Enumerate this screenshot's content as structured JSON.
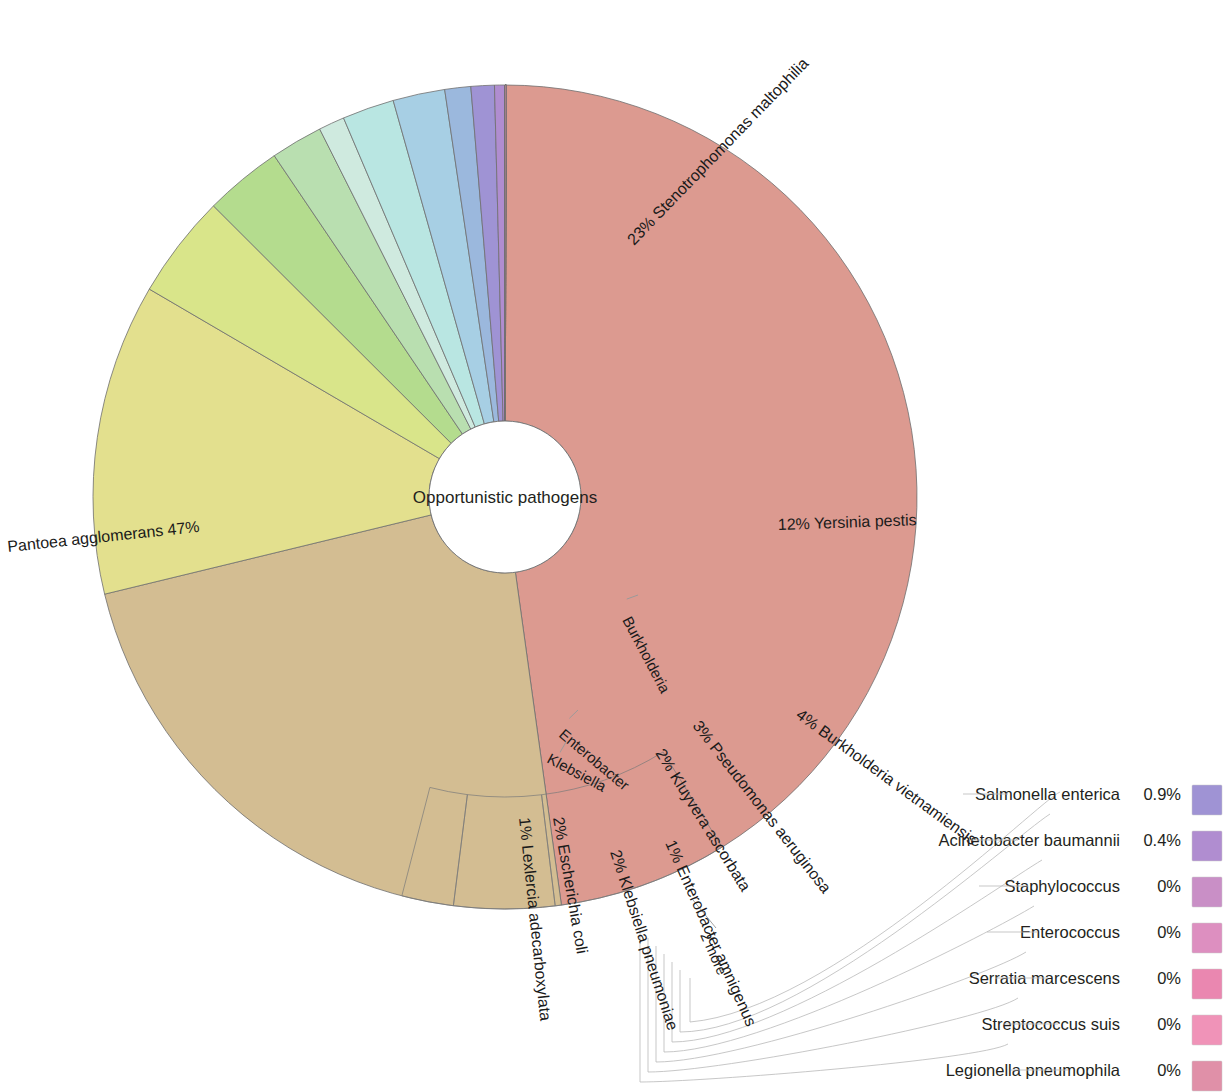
{
  "chart": {
    "type": "donut",
    "center_label": "Opportunistic pathogens",
    "title": "",
    "units": "percent"
  },
  "chart_data": {
    "type": "pie",
    "title": "Opportunistic pathogens",
    "center_label": "Opportunistic pathogens",
    "xlabel": "",
    "ylabel": "",
    "legend_position": "right",
    "grid": false,
    "value_suffix": "%",
    "categories": [
      "Pantoea agglomerans",
      "Stenotrophomonas maltophilia",
      "Yersinia pestis",
      "Burkholderia vietnamiensis",
      "Pseudomonas aeruginosa",
      "Kluyvera ascorbata",
      "Enterobacter amnigenus",
      "Klebsiella pneumoniae",
      "Escherichia coli",
      "Lexlercia adecarboxylata",
      "Salmonella enterica",
      "Acinetobacter baumannii",
      "Staphylococcus",
      "Enterococcus",
      "Serratia marcescens",
      "Streptococcus suis",
      "Legionella pneumophila"
    ],
    "values": [
      47,
      23,
      12,
      4,
      3,
      2,
      1,
      2,
      2,
      1,
      0.9,
      0.4,
      0,
      0,
      0,
      0,
      0
    ],
    "colors": [
      "#dc9a90",
      "#d3bd92",
      "#e3e08e",
      "#d9e58a",
      "#b4dc8e",
      "#b9dfb0",
      "#cfeadf",
      "#b9e6e2",
      "#a7cfe4",
      "#9bb8dd",
      "#9f93d4",
      "#b08dd0",
      "#c98fc6",
      "#dd8fc0",
      "#ea87b0",
      "#f093b8",
      "#e090a8"
    ],
    "genus_ring": [
      {
        "label": "Burkholderia",
        "color": "#c7e08c"
      },
      {
        "label": "Enterobacter",
        "color": "#cfeadf"
      },
      {
        "label": "Klebsiella",
        "color": "#bfe4e0"
      }
    ]
  },
  "slice_labels": [
    {
      "name": "Pantoea agglomerans",
      "pct": "47%",
      "text": "Pantoea agglomerans   47%"
    },
    {
      "name": "Stenotrophomonas maltophilia",
      "pct": "23%",
      "text": "23%   Stenotrophomonas maltophilia"
    },
    {
      "name": "Yersinia pestis",
      "pct": "12%",
      "text": "12%   Yersinia pestis"
    },
    {
      "name": "Burkholderia vietnamiensis",
      "pct": "4%",
      "text": "4%   Burkholderia vietnamiensis"
    },
    {
      "name": "Pseudomonas aeruginosa",
      "pct": "3%",
      "text": "3%   Pseudomonas aeruginosa"
    },
    {
      "name": "Kluyvera ascorbata",
      "pct": "2%",
      "text": "2%   Kluyvera ascorbata"
    },
    {
      "name": "Enterobacter amnigenus",
      "pct": "1%",
      "text": "1%   Enterobacter amnigenus"
    },
    {
      "name": "Klebsiella pneumoniae",
      "pct": "2%",
      "text": "2%   Klebsiella pneumoniae"
    },
    {
      "name": "Escherichia coli",
      "pct": "2%",
      "text": "2%   Escherichia coli"
    },
    {
      "name": "Lexlercia adecarboxylata",
      "pct": "1%",
      "text": "1%   Lexlercia adecarboxylata"
    },
    {
      "name": "2 more",
      "pct": "",
      "text": "2 more"
    }
  ],
  "ring_labels": [
    {
      "label": "Burkholderia"
    },
    {
      "label": "Enterobacter"
    },
    {
      "label": "Klebsiella"
    }
  ],
  "legend": {
    "items": [
      {
        "label": "Salmonella enterica",
        "value": "0.9%",
        "color": "#9f93d4"
      },
      {
        "label": "Acinetobacter baumannii",
        "value": "0.4%",
        "color": "#b08dd0"
      },
      {
        "label": "Staphylococcus",
        "value": "0%",
        "color": "#c98fc6"
      },
      {
        "label": "Enterococcus",
        "value": "0%",
        "color": "#dd8fc0"
      },
      {
        "label": "Serratia marcescens",
        "value": "0%",
        "color": "#ea87b0"
      },
      {
        "label": "Streptococcus suis",
        "value": "0%",
        "color": "#f093b8"
      },
      {
        "label": "Legionella pneumophila",
        "value": "0%",
        "color": "#e090a8"
      }
    ]
  }
}
